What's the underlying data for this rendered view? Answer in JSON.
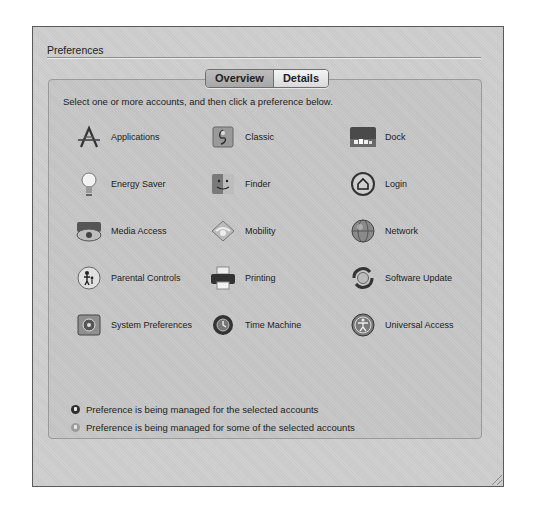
{
  "window": {
    "section_title": "Preferences",
    "tabs": [
      {
        "label": "Overview",
        "selected": true
      },
      {
        "label": "Details",
        "selected": false
      }
    ],
    "instructions": "Select one or more accounts, and then click a preference below.",
    "preferences": [
      {
        "label": "Applications",
        "icon": "app-store-a-icon"
      },
      {
        "label": "Classic",
        "icon": "classic-icon"
      },
      {
        "label": "Dock",
        "icon": "dock-icon"
      },
      {
        "label": "Energy Saver",
        "icon": "lightbulb-icon"
      },
      {
        "label": "Finder",
        "icon": "finder-icon"
      },
      {
        "label": "Login",
        "icon": "login-house-icon"
      },
      {
        "label": "Media Access",
        "icon": "media-access-icon"
      },
      {
        "label": "Mobility",
        "icon": "mobility-icon"
      },
      {
        "label": "Network",
        "icon": "network-globe-icon"
      },
      {
        "label": "Parental Controls",
        "icon": "parental-controls-icon"
      },
      {
        "label": "Printing",
        "icon": "printer-icon"
      },
      {
        "label": "Software Update",
        "icon": "software-update-icon"
      },
      {
        "label": "System Preferences",
        "icon": "system-preferences-icon"
      },
      {
        "label": "Time Machine",
        "icon": "time-machine-icon"
      },
      {
        "label": "Universal Access",
        "icon": "universal-access-icon"
      }
    ],
    "legend": [
      {
        "label": "Preference is being managed for the selected accounts",
        "state": "full"
      },
      {
        "label": "Preference is being managed for some of the selected accounts",
        "state": "partial"
      }
    ]
  }
}
